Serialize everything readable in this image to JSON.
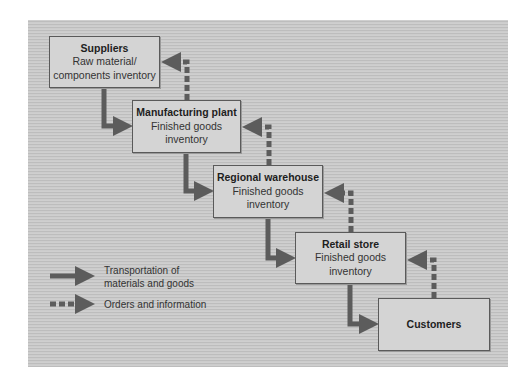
{
  "diagram": {
    "type": "supply-chain-flow",
    "colors": {
      "panel_bg": "#c9c9c9",
      "box_fill": "#d4d4d4",
      "box_border": "#5a5a5a",
      "arrow": "#5c5c5c",
      "text": "#222222"
    },
    "nodes": [
      {
        "id": "suppliers",
        "title": "Suppliers",
        "line1": "Raw material/",
        "line2": "components inventory"
      },
      {
        "id": "manufacturing",
        "title": "Manufacturing plant",
        "line1": "Finished goods",
        "line2": "inventory"
      },
      {
        "id": "warehouse",
        "title": "Regional warehouse",
        "line1": "Finished goods",
        "line2": "inventory"
      },
      {
        "id": "retail",
        "title": "Retail store",
        "line1": "Finished goods",
        "line2": "inventory"
      },
      {
        "id": "customers",
        "title": "Customers"
      }
    ],
    "edges": [
      {
        "from": "suppliers",
        "to": "manufacturing",
        "kind": "transportation"
      },
      {
        "from": "manufacturing",
        "to": "warehouse",
        "kind": "transportation"
      },
      {
        "from": "warehouse",
        "to": "retail",
        "kind": "transportation"
      },
      {
        "from": "retail",
        "to": "customers",
        "kind": "transportation"
      },
      {
        "from": "manufacturing",
        "to": "suppliers",
        "kind": "orders"
      },
      {
        "from": "warehouse",
        "to": "manufacturing",
        "kind": "orders"
      },
      {
        "from": "retail",
        "to": "warehouse",
        "kind": "orders"
      },
      {
        "from": "customers",
        "to": "retail",
        "kind": "orders"
      }
    ],
    "legend": {
      "solid": {
        "line1": "Transportation of",
        "line2": "materials and goods"
      },
      "dashed": {
        "label": "Orders and information"
      }
    }
  }
}
